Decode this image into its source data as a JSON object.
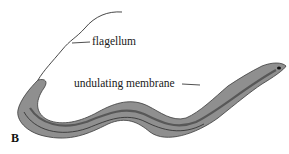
{
  "figure": {
    "panel_letter": "B",
    "labels": {
      "flagellum": "flagellum",
      "undulating_membrane": "undulating membrane"
    },
    "colors": {
      "body_fill": "#8f8f8f",
      "body_dark": "#4a4a4a",
      "line": "#222222"
    }
  }
}
